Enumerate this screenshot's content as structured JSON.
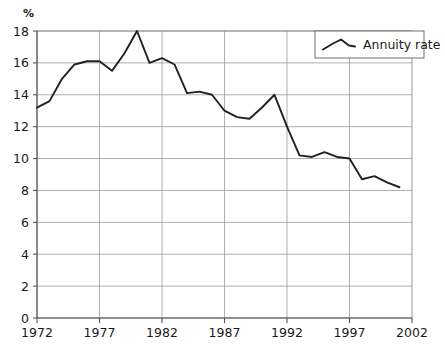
{
  "chart_data": {
    "type": "line",
    "title": "",
    "xlabel": "",
    "ylabel": "%",
    "unit_label": "%",
    "xlim": [
      1972,
      2002
    ],
    "ylim": [
      0,
      18
    ],
    "grid": true,
    "legend_position": "top-right",
    "x_tick_labels": [
      "1972",
      "1977",
      "1982",
      "1987",
      "1992",
      "1997",
      "2002"
    ],
    "x_ticks": [
      1972,
      1977,
      1982,
      1987,
      1992,
      1997,
      2002
    ],
    "y_tick_labels": [
      "0",
      "2",
      "4",
      "6",
      "8",
      "10",
      "12",
      "14",
      "16",
      "18"
    ],
    "y_ticks": [
      0,
      2,
      4,
      6,
      8,
      10,
      12,
      14,
      16,
      18
    ],
    "series": [
      {
        "name": "Annuity rate",
        "color": "#212121",
        "x": [
          1972,
          1973,
          1974,
          1975,
          1976,
          1977,
          1978,
          1979,
          1980,
          1981,
          1982,
          1983,
          1984,
          1985,
          1986,
          1987,
          1988,
          1989,
          1990,
          1991,
          1992,
          1993,
          1994,
          1995,
          1996,
          1997,
          1998,
          1999,
          2000,
          2001
        ],
        "values": [
          13.2,
          13.6,
          15.0,
          15.9,
          16.1,
          16.1,
          15.5,
          16.6,
          18.0,
          16.0,
          16.3,
          15.9,
          14.1,
          14.2,
          14.0,
          13.0,
          12.6,
          12.5,
          13.2,
          14.0,
          12.0,
          10.2,
          10.1,
          10.4,
          10.1,
          10.0,
          8.7,
          8.9,
          8.5,
          8.2
        ]
      }
    ],
    "legend": [
      {
        "label": "Annuity rate",
        "color": "#212121"
      }
    ]
  },
  "colors": {
    "line": "#212121",
    "grid": "#9a9a9a",
    "axis": "#555555",
    "background": "#ffffff",
    "text": "#1a1a1a"
  }
}
